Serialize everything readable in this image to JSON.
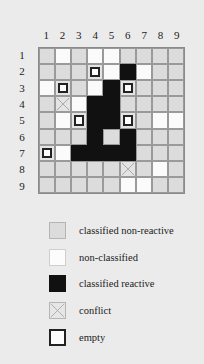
{
  "figure": {
    "column_labels": [
      "1",
      "2",
      "3",
      "4",
      "5",
      "6",
      "7",
      "8",
      "9"
    ],
    "row_labels": [
      "1",
      "2",
      "3",
      "4",
      "5",
      "6",
      "7",
      "8",
      "9"
    ],
    "state_codes": {
      "cnr": "classified non-reactive",
      "nc": "non-classified",
      "cr": "classified reactive",
      "conflict": "conflict",
      "empty": "empty"
    },
    "grid": [
      [
        "cnr",
        "nc",
        "cnr",
        "nc",
        "nc",
        "cnr",
        "cnr",
        "cnr",
        "cnr"
      ],
      [
        "cnr",
        "cnr",
        "cnr",
        "empty",
        "nc",
        "cr",
        "nc",
        "cnr",
        "cnr"
      ],
      [
        "nc",
        "empty",
        "cnr",
        "nc",
        "cr",
        "empty",
        "cnr",
        "cnr",
        "cnr"
      ],
      [
        "cnr",
        "conflict",
        "nc",
        "cr",
        "cr",
        "cnr",
        "cnr",
        "cnr",
        "cnr"
      ],
      [
        "cnr",
        "nc",
        "empty",
        "cr",
        "cr",
        "empty",
        "cnr",
        "nc",
        "nc"
      ],
      [
        "cnr",
        "cnr",
        "cnr",
        "cr",
        "cnr",
        "cr",
        "cnr",
        "cnr",
        "cnr"
      ],
      [
        "empty",
        "nc",
        "cr",
        "cr",
        "cr",
        "cr",
        "cnr",
        "cnr",
        "cnr"
      ],
      [
        "cnr",
        "cnr",
        "cnr",
        "cnr",
        "cnr",
        "conflict",
        "cnr",
        "nc",
        "cnr"
      ],
      [
        "cnr",
        "cnr",
        "cnr",
        "cnr",
        "cnr",
        "nc",
        "nc",
        "cnr",
        "cnr"
      ]
    ]
  },
  "legend": {
    "items": [
      {
        "code": "cnr",
        "label": "classified non-reactive"
      },
      {
        "code": "nc",
        "label": "non-classified"
      },
      {
        "code": "cr",
        "label": "classified reactive"
      },
      {
        "code": "conflict",
        "label": "conflict"
      },
      {
        "code": "empty",
        "label": "empty"
      }
    ]
  },
  "colors": {
    "classified_non_reactive": "#dcdcdc",
    "non_classified": "#fbfbfb",
    "classified_reactive": "#111111",
    "background": "#ebebeb"
  }
}
